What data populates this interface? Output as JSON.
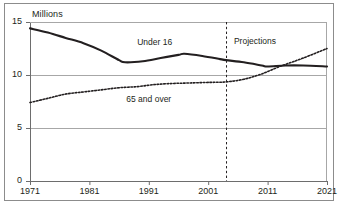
{
  "chart_data": {
    "type": "line",
    "title": "",
    "subtitle": "",
    "xlabel": "",
    "ylabel": "Millions",
    "xlim": [
      1971,
      2021
    ],
    "ylim": [
      0,
      15
    ],
    "yticks": [
      "0",
      "5",
      "10",
      "15"
    ],
    "ytick_values": [
      0,
      5,
      10,
      15
    ],
    "xticks": [
      "1971",
      "1981",
      "1991",
      "2001",
      "2011",
      "2021"
    ],
    "xtick_values": [
      1971,
      1981,
      1991,
      2001,
      2011,
      2021
    ],
    "grid": "horizontal",
    "legend_position": "inline-labels",
    "annotations": [
      {
        "name": "projections-divider",
        "text": "Projections",
        "x": 2004,
        "type": "vertical-dashed-line",
        "label_x": 2005,
        "label_y": 13.1
      }
    ],
    "series": [
      {
        "name": "Under 16",
        "style": "solid",
        "color": "#231f20",
        "label_x": 1992,
        "label_y": 13.0,
        "x": [
          1971,
          1974,
          1977,
          1980,
          1983,
          1986,
          1987,
          1990,
          1993,
          1996,
          1997,
          2000,
          2003,
          2004,
          2007,
          2010,
          2011,
          2014,
          2017,
          2021
        ],
        "values": [
          14.4,
          14.0,
          13.5,
          13.0,
          12.3,
          11.4,
          11.2,
          11.3,
          11.6,
          11.9,
          12.0,
          11.8,
          11.5,
          11.4,
          11.2,
          10.9,
          10.8,
          10.9,
          10.9,
          10.8
        ]
      },
      {
        "name": "65 and over",
        "style": "dotted",
        "color": "#231f20",
        "label_x": 1991,
        "label_y": 7.6,
        "x": [
          1971,
          1974,
          1977,
          1980,
          1983,
          1986,
          1989,
          1992,
          1995,
          1998,
          2001,
          2004,
          2007,
          2010,
          2013,
          2014,
          2017,
          2021
        ],
        "values": [
          7.4,
          7.8,
          8.2,
          8.4,
          8.6,
          8.8,
          8.9,
          9.1,
          9.2,
          9.25,
          9.3,
          9.35,
          9.6,
          10.1,
          10.8,
          11.0,
          11.6,
          12.5
        ]
      }
    ]
  },
  "axis": {
    "y_axis_title": "Millions"
  }
}
